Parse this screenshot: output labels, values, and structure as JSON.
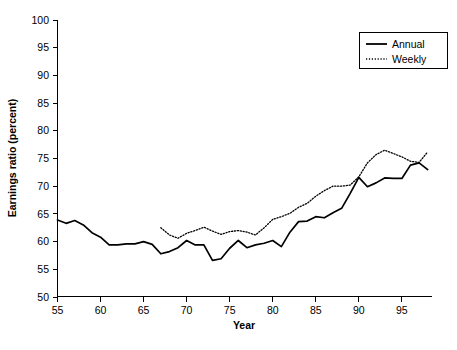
{
  "chart_data": {
    "type": "line",
    "title": "",
    "xlabel": "Year",
    "ylabel": "Earnings ratio (percent)",
    "xlim": [
      55,
      98.5
    ],
    "ylim": [
      50,
      100
    ],
    "xticks": [
      55,
      60,
      65,
      70,
      75,
      80,
      85,
      90,
      95
    ],
    "yticks": [
      50,
      55,
      60,
      65,
      70,
      75,
      80,
      85,
      90,
      95,
      100
    ],
    "xtick_labels": [
      "55",
      "60",
      "65",
      "70",
      "75",
      "80",
      "85",
      "90",
      "95"
    ],
    "ytick_labels": [
      "50",
      "55",
      "60",
      "65",
      "70",
      "75",
      "80",
      "85",
      "90",
      "95",
      "100"
    ],
    "grid": false,
    "legend_position": "top-right",
    "line_color": "#000000",
    "series": [
      {
        "name": "Annual",
        "style": "solid",
        "x": [
          55,
          56,
          57,
          58,
          59,
          60,
          61,
          62,
          63,
          64,
          65,
          66,
          67,
          68,
          69,
          70,
          71,
          72,
          73,
          74,
          75,
          76,
          77,
          78,
          79,
          80,
          81,
          82,
          83,
          84,
          85,
          86,
          87,
          88,
          89,
          90,
          91,
          92,
          93,
          94,
          95,
          96,
          97,
          98
        ],
        "values": [
          63.9,
          63.3,
          63.8,
          63.0,
          61.6,
          60.8,
          59.4,
          59.4,
          59.6,
          59.6,
          60.0,
          59.5,
          57.8,
          58.2,
          58.9,
          60.2,
          59.4,
          59.4,
          56.6,
          56.9,
          58.8,
          60.2,
          58.9,
          59.4,
          59.7,
          60.2,
          59.1,
          61.7,
          63.6,
          63.7,
          64.5,
          64.3,
          65.2,
          66.0,
          68.7,
          71.6,
          69.9,
          70.6,
          71.5,
          71.4,
          71.4,
          73.8,
          74.2,
          73.0
        ]
      },
      {
        "name": "Weekly",
        "style": "dotted",
        "x": [
          67,
          68,
          69,
          70,
          71,
          72,
          73,
          74,
          75,
          76,
          77,
          78,
          79,
          80,
          81,
          82,
          83,
          84,
          85,
          86,
          87,
          88,
          89,
          90,
          91,
          92,
          93,
          94,
          95,
          96,
          97,
          98
        ],
        "values": [
          62.5,
          61.2,
          60.6,
          61.5,
          62.0,
          62.6,
          61.9,
          61.3,
          61.8,
          62.0,
          61.7,
          61.2,
          62.5,
          64.0,
          64.5,
          65.1,
          66.2,
          66.9,
          68.2,
          69.2,
          70.0,
          70.0,
          70.2,
          71.7,
          74.2,
          75.7,
          76.5,
          75.9,
          75.3,
          74.5,
          74.3,
          76.2
        ]
      }
    ]
  },
  "legend": {
    "entries": [
      {
        "label": "Annual",
        "style": "solid"
      },
      {
        "label": "Weekly",
        "style": "dotted"
      }
    ]
  }
}
